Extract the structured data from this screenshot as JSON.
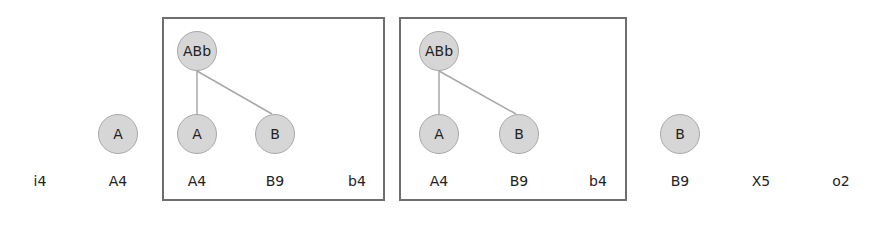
{
  "frames": [
    {
      "id": "frame-1",
      "x": 162,
      "y": 17,
      "w": 223,
      "h": 184
    },
    {
      "id": "frame-2",
      "x": 399,
      "y": 17,
      "w": 228,
      "h": 184
    }
  ],
  "nodes": [
    {
      "id": "n1",
      "label": "A",
      "x": 118,
      "y": 134
    },
    {
      "id": "n2",
      "label": "ABb",
      "x": 197,
      "y": 51
    },
    {
      "id": "n3",
      "label": "A",
      "x": 197,
      "y": 134
    },
    {
      "id": "n4",
      "label": "B",
      "x": 275,
      "y": 134
    },
    {
      "id": "n5",
      "label": "ABb",
      "x": 439,
      "y": 51
    },
    {
      "id": "n6",
      "label": "A",
      "x": 439,
      "y": 134
    },
    {
      "id": "n7",
      "label": "B",
      "x": 519,
      "y": 134
    },
    {
      "id": "n8",
      "label": "B",
      "x": 680,
      "y": 134
    }
  ],
  "edges": [
    {
      "from": "n2",
      "to": "n3"
    },
    {
      "from": "n2",
      "to": "n4"
    },
    {
      "from": "n5",
      "to": "n6"
    },
    {
      "from": "n5",
      "to": "n7"
    }
  ],
  "labels": [
    {
      "text": "i4",
      "x": 40,
      "y": 181
    },
    {
      "text": "A4",
      "x": 118,
      "y": 181
    },
    {
      "text": "A4",
      "x": 197,
      "y": 181
    },
    {
      "text": "B9",
      "x": 275,
      "y": 181
    },
    {
      "text": "b4",
      "x": 357,
      "y": 181
    },
    {
      "text": "A4",
      "x": 439,
      "y": 181
    },
    {
      "text": "B9",
      "x": 519,
      "y": 181
    },
    {
      "text": "b4",
      "x": 598,
      "y": 181
    },
    {
      "text": "B9",
      "x": 680,
      "y": 181
    },
    {
      "text": "X5",
      "x": 761,
      "y": 181
    },
    {
      "text": "o2",
      "x": 841,
      "y": 181
    }
  ],
  "colors": {
    "node_fill": "#d6d6d6",
    "node_border": "#a8a8a8",
    "edge": "#a8a8a8",
    "frame_border": "#6e6e6e"
  }
}
